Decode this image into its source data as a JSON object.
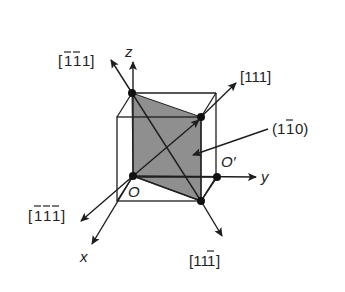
{
  "diagram": {
    "type": "cubic unit cell with crystal directions and plane",
    "axes": {
      "x": "x",
      "y": "y",
      "z": "z"
    },
    "points": {
      "origin": "O",
      "origin_prime": "O′"
    },
    "directions": [
      {
        "label": "[1̄1̄1]",
        "parts": [
          "[",
          "1",
          "1",
          "1]"
        ],
        "bars": [
          true,
          true,
          false
        ]
      },
      {
        "label": "[111]",
        "parts": [
          "[111]"
        ]
      },
      {
        "label": "[1̄1̄1̄]",
        "parts": [
          "[",
          "1",
          "1",
          "1",
          "]"
        ],
        "bars": [
          true,
          true,
          true
        ]
      },
      {
        "label": "[111̄]",
        "parts": [
          "[11",
          "1",
          "]"
        ],
        "bars": [
          false,
          false,
          true
        ]
      }
    ],
    "plane": {
      "label": "(11̄0)",
      "parts": [
        "(1",
        "1",
        "0)"
      ],
      "fill": "#8c8c8c"
    },
    "colors": {
      "line": "#1e1e1e",
      "shade": "#8f8f8f",
      "background": "#ffffff"
    }
  }
}
